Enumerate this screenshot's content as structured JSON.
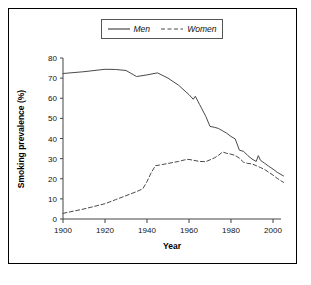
{
  "chart_data": {
    "type": "line",
    "title": "",
    "xlabel": "Year",
    "ylabel": "Smoking prevalence (%)",
    "xlim": [
      1900,
      2010
    ],
    "ylim": [
      0,
      80
    ],
    "xticks": [
      1900,
      1920,
      1940,
      1960,
      1980,
      2000
    ],
    "yticks": [
      0,
      10,
      20,
      30,
      40,
      50,
      60,
      70,
      80
    ],
    "grid": false,
    "legend_position": "top-center",
    "series": [
      {
        "name": "Men",
        "style": "solid",
        "color": "#4a4a4a",
        "x": [
          1900,
          1910,
          1920,
          1925,
          1930,
          1935,
          1940,
          1945,
          1950,
          1955,
          1960,
          1962,
          1963,
          1965,
          1968,
          1970,
          1972,
          1974,
          1976,
          1978,
          1980,
          1982,
          1984,
          1986,
          1988,
          1990,
          1992,
          1993,
          1994,
          1996,
          1998,
          2000,
          2002,
          2005
        ],
        "y": [
          72.3,
          73.2,
          74.4,
          74.3,
          73.8,
          70.8,
          71.6,
          72.6,
          70.0,
          66.5,
          61.8,
          59.5,
          61.0,
          57.0,
          51.0,
          46.0,
          45.6,
          45.0,
          43.8,
          42.6,
          41.0,
          39.8,
          34.2,
          33.6,
          31.5,
          29.8,
          28.6,
          31.5,
          29.2,
          27.7,
          26.2,
          24.8,
          23.2,
          21.4
        ]
      },
      {
        "name": "Women",
        "style": "dashed",
        "color": "#4a4a4a",
        "x": [
          1900,
          1910,
          1920,
          1925,
          1930,
          1935,
          1938,
          1940,
          1942,
          1944,
          1946,
          1950,
          1955,
          1958,
          1960,
          1962,
          1965,
          1968,
          1970,
          1972,
          1974,
          1976,
          1978,
          1980,
          1982,
          1984,
          1986,
          1988,
          1990,
          1992,
          1994,
          1996,
          1998,
          2000,
          2002,
          2005
        ],
        "y": [
          2.8,
          5.0,
          7.6,
          9.6,
          11.6,
          13.6,
          15.0,
          18.6,
          23.0,
          26.5,
          26.8,
          27.6,
          28.6,
          29.4,
          29.6,
          29.2,
          28.6,
          28.5,
          29.4,
          30.3,
          31.6,
          33.3,
          32.6,
          32.2,
          31.6,
          30.2,
          28.2,
          27.6,
          27.4,
          26.5,
          25.6,
          24.6,
          23.2,
          21.8,
          20.2,
          18.2
        ]
      }
    ]
  },
  "legend": {
    "entries": [
      {
        "label": "Men",
        "style": "solid"
      },
      {
        "label": "Women",
        "style": "dashed"
      }
    ]
  },
  "axes": {
    "x_title": "Year",
    "y_title": "Smoking prevalence (%)",
    "x_tick_labels": [
      "1900",
      "1920",
      "1940",
      "1960",
      "1980",
      "2000"
    ],
    "y_tick_labels": [
      "0",
      "10",
      "20",
      "30",
      "40",
      "50",
      "60",
      "70",
      "80"
    ]
  }
}
